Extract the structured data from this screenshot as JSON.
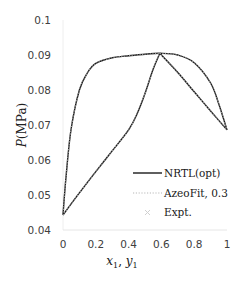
{
  "chart_data": {
    "type": "line",
    "title": "",
    "xlabel": "x1, y1",
    "ylabel": "P(MPa)",
    "xlim": [
      0,
      1
    ],
    "ylim": [
      0.04,
      0.1
    ],
    "xticks": [
      "0",
      "0.2",
      "0.4",
      "0.6",
      "0.8",
      "1"
    ],
    "yticks": [
      "0.04",
      "0.05",
      "0.06",
      "0.07",
      "0.08",
      "0.09",
      "0.1"
    ],
    "grid": false,
    "legend_position": "lower right",
    "series": [
      {
        "name": "NRTL(opt)",
        "style": "solid",
        "color": "#1a1a1a",
        "branches": [
          {
            "label": "bubble (x1)",
            "x": [
              0,
              0.1,
              0.2,
              0.3,
              0.4,
              0.45,
              0.5,
              0.55,
              0.59,
              0.7,
              0.8,
              0.9,
              1.0
            ],
            "y": [
              0.0443,
              0.0506,
              0.0567,
              0.0626,
              0.0686,
              0.073,
              0.079,
              0.086,
              0.0905,
              0.085,
              0.0795,
              0.074,
              0.0686
            ]
          },
          {
            "label": "dew (y1)",
            "x": [
              0,
              0.02,
              0.05,
              0.1,
              0.15,
              0.2,
              0.3,
              0.4,
              0.5,
              0.59,
              0.7,
              0.8,
              0.9,
              0.95,
              1.0
            ],
            "y": [
              0.0443,
              0.056,
              0.069,
              0.08,
              0.085,
              0.0876,
              0.0892,
              0.0898,
              0.0902,
              0.0905,
              0.09,
              0.0878,
              0.082,
              0.076,
              0.0686
            ]
          }
        ]
      },
      {
        "name": "AzeoFit, 0.3",
        "style": "dotted",
        "color": "#9a9a9a",
        "branches": [
          {
            "label": "bubble (x1)",
            "x": [
              0,
              0.1,
              0.2,
              0.3,
              0.4,
              0.45,
              0.5,
              0.55,
              0.59,
              0.7,
              0.8,
              0.9,
              1.0
            ],
            "y": [
              0.0443,
              0.0506,
              0.0567,
              0.0626,
              0.0686,
              0.073,
              0.079,
              0.086,
              0.0905,
              0.085,
              0.0795,
              0.074,
              0.0686
            ]
          },
          {
            "label": "dew (y1)",
            "x": [
              0,
              0.02,
              0.05,
              0.1,
              0.15,
              0.2,
              0.3,
              0.4,
              0.5,
              0.59,
              0.7,
              0.8,
              0.9,
              0.95,
              1.0
            ],
            "y": [
              0.0443,
              0.056,
              0.069,
              0.08,
              0.085,
              0.0876,
              0.0892,
              0.0898,
              0.0902,
              0.0905,
              0.09,
              0.0878,
              0.082,
              0.076,
              0.0686
            ]
          }
        ]
      },
      {
        "name": "Expt.",
        "style": "marker-x",
        "color": "#c8c8c8",
        "x": [],
        "y": []
      }
    ],
    "annotations": []
  },
  "legend": {
    "items": [
      {
        "label": "NRTL(opt)"
      },
      {
        "label": "AzeoFit, 0.3"
      },
      {
        "label": "Expt."
      }
    ]
  },
  "axes": {
    "x_label_main": "x",
    "x_label_sub1": "1",
    "x_label_sep": ", ",
    "x_label_main2": "y",
    "x_label_sub2": "1",
    "y_label_italic": "P",
    "y_label_rest": "(MPa)"
  }
}
